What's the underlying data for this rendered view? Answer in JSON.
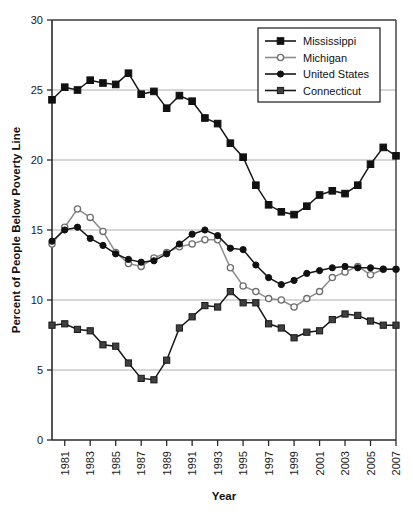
{
  "chart_data": {
    "type": "line",
    "title": "",
    "xlabel": "Year",
    "ylabel": "Percent of People Below Poverty Line",
    "xlim": [
      1980,
      2007
    ],
    "ylim": [
      0,
      30
    ],
    "yticks": [
      0,
      5,
      10,
      15,
      20,
      25,
      30
    ],
    "ytick_labels": [
      "0",
      "5",
      "10",
      "15",
      "20",
      "25",
      "30"
    ],
    "xticks": [
      1981,
      1983,
      1985,
      1987,
      1989,
      1991,
      1993,
      1995,
      1997,
      1999,
      2001,
      2003,
      2005,
      2007
    ],
    "xtick_labels": [
      "1981",
      "1983",
      "1985",
      "1987",
      "1989",
      "1991",
      "1993",
      "1995",
      "1997",
      "1999",
      "2001",
      "2003",
      "2005",
      "2007"
    ],
    "grid": "horizontal",
    "legend_position": "top-right",
    "x": [
      1980,
      1981,
      1982,
      1983,
      1984,
      1985,
      1986,
      1987,
      1988,
      1989,
      1990,
      1991,
      1992,
      1993,
      1994,
      1995,
      1996,
      1997,
      1998,
      1999,
      2000,
      2001,
      2002,
      2003,
      2004,
      2005,
      2006,
      2007
    ],
    "series": [
      {
        "name": "Mississippi",
        "marker": "filled-square",
        "color": "#111111",
        "values": [
          24.3,
          25.2,
          25.0,
          25.7,
          25.5,
          25.4,
          26.2,
          24.7,
          24.9,
          23.7,
          24.6,
          24.2,
          23.0,
          22.6,
          21.2,
          20.2,
          18.2,
          16.8,
          16.3,
          16.1,
          16.7,
          17.5,
          17.8,
          17.6,
          18.2,
          19.7,
          20.9,
          20.3
        ]
      },
      {
        "name": "Michigan",
        "marker": "open-circle",
        "color": "#8a8a8a",
        "values": [
          14.0,
          15.2,
          16.5,
          15.9,
          14.9,
          13.4,
          12.6,
          12.4,
          13.0,
          13.4,
          13.8,
          14.0,
          14.3,
          14.3,
          12.3,
          11.0,
          10.6,
          10.1,
          10.0,
          9.5,
          10.1,
          10.6,
          11.6,
          12.0,
          12.4,
          11.8,
          12.2,
          12.2
        ]
      },
      {
        "name": "United States",
        "marker": "filled-circle",
        "color": "#111111",
        "values": [
          14.2,
          15.0,
          15.2,
          14.4,
          13.9,
          13.3,
          12.9,
          12.7,
          12.8,
          13.3,
          14.0,
          14.7,
          15.0,
          14.6,
          13.7,
          13.6,
          12.5,
          11.6,
          11.1,
          11.4,
          11.9,
          12.1,
          12.3,
          12.4,
          12.3,
          12.3,
          12.2,
          12.2
        ]
      },
      {
        "name": "Connecticut",
        "marker": "gray-square",
        "color": "#3a3a3a",
        "values": [
          8.2,
          8.3,
          7.9,
          7.8,
          6.8,
          6.7,
          5.5,
          4.4,
          4.3,
          5.7,
          8.0,
          8.8,
          9.6,
          9.5,
          10.6,
          9.8,
          9.8,
          8.3,
          8.0,
          7.3,
          7.7,
          7.8,
          8.6,
          9.0,
          8.9,
          8.5,
          8.2,
          8.2
        ]
      }
    ]
  },
  "legend": {
    "items": [
      {
        "label": "Mississippi"
      },
      {
        "label": "Michigan"
      },
      {
        "label": "United States"
      },
      {
        "label": "Connecticut"
      }
    ]
  },
  "footer": {
    "source_note": ""
  }
}
